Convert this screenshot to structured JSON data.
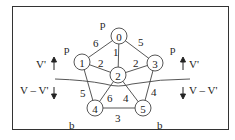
{
  "diagram": {
    "nodes": [
      {
        "id": "0",
        "label": "0",
        "x": 119,
        "y": 36,
        "tag": "p"
      },
      {
        "id": "1",
        "label": "1",
        "x": 82,
        "y": 62,
        "tag": "p"
      },
      {
        "id": "2",
        "label": "2",
        "x": 118,
        "y": 75,
        "tag": ""
      },
      {
        "id": "3",
        "label": "3",
        "x": 155,
        "y": 63,
        "tag": "p"
      },
      {
        "id": "4",
        "label": "4",
        "x": 95,
        "y": 108,
        "tag": "b"
      },
      {
        "id": "5",
        "label": "5",
        "x": 143,
        "y": 108,
        "tag": "b"
      }
    ],
    "edges": [
      {
        "from": "0",
        "to": "1",
        "weight": "6"
      },
      {
        "from": "0",
        "to": "2",
        "weight": "1"
      },
      {
        "from": "0",
        "to": "3",
        "weight": "5"
      },
      {
        "from": "1",
        "to": "2",
        "weight": "2"
      },
      {
        "from": "3",
        "to": "2",
        "weight": "2"
      },
      {
        "from": "1",
        "to": "4",
        "weight": "5"
      },
      {
        "from": "2",
        "to": "4",
        "weight": "6"
      },
      {
        "from": "2",
        "to": "5",
        "weight": "4"
      },
      {
        "from": "3",
        "to": "5",
        "weight": "4"
      },
      {
        "from": "4",
        "to": "5",
        "weight": "3"
      }
    ],
    "node_tags": {
      "n0": "p",
      "n1": "p",
      "n3": "p",
      "n4": "b",
      "n5": "b"
    },
    "partition": {
      "upper_left": "V'",
      "lower_left": "V – V'",
      "upper_right": "V'",
      "lower_right": "V – V'"
    },
    "weights": {
      "e01": "6",
      "e02": "1",
      "e03": "5",
      "e12": "2",
      "e32": "2",
      "e14": "5",
      "e24": "6",
      "e25": "4",
      "e35": "4",
      "e45": "3"
    },
    "labels": {
      "n0": "0",
      "n1": "1",
      "n2": "2",
      "n3": "3",
      "n4": "4",
      "n5": "5"
    }
  }
}
